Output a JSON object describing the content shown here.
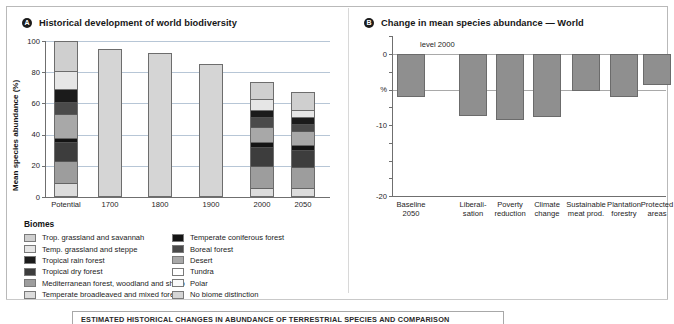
{
  "panels": {
    "left": {
      "marker": "A",
      "title": "Historical development of world biodiversity"
    },
    "right": {
      "marker": "B",
      "title": "Change in mean species abundance — World"
    }
  },
  "caption": "ESTIMATED HISTORICAL CHANGES IN ABUNDANCE OF TERRESTRIAL SPECIES AND COMPARISON",
  "legend": {
    "title": "Biomes",
    "col1": [
      {
        "label": "Trop. grassland and savannah",
        "color": "#cfcfcf"
      },
      {
        "label": "Temp. grassland and steppe",
        "color": "#e6e6e6"
      },
      {
        "label": "Tropical rain forest",
        "color": "#1b1b1b"
      },
      {
        "label": "Tropical dry forest",
        "color": "#3d3d3d"
      },
      {
        "label": "Mediterranean forest, woodland and shrub",
        "color": "#9d9d9d"
      },
      {
        "label": "Temperate broadleaved and mixed forest",
        "color": "#dcdcdc"
      }
    ],
    "col2": [
      {
        "label": "Temperate coniferous forest",
        "color": "#141414"
      },
      {
        "label": "Boreal forest",
        "color": "#4a4a4a"
      },
      {
        "label": "Desert",
        "color": "#a8a8a8"
      },
      {
        "label": "Tundra",
        "color": "#ffffff"
      },
      {
        "label": "Polar",
        "color": "#fafafa"
      },
      {
        "label": "No biome distinction",
        "color": "#d5d5d5"
      }
    ]
  },
  "chart_data": [
    {
      "id": "historical-biodiversity",
      "type": "bar",
      "stacked": true,
      "title": "Historical development of world biodiversity",
      "xlabel": "",
      "ylabel": "Mean species abundance (%)",
      "ylim": [
        0,
        100
      ],
      "yticks": [
        0,
        20,
        40,
        60,
        80,
        100
      ],
      "grid": true,
      "legend_position": "below",
      "categories": [
        "Potential",
        "1700",
        "1800",
        "1900",
        "2000",
        "2050"
      ],
      "totals": [
        100,
        95,
        92,
        85,
        74,
        67
      ],
      "series": [
        {
          "name": "Temperate broadleaved and mixed forest",
          "color": "#dcdcdc",
          "values": [
            9,
            0,
            0,
            0,
            6,
            6
          ]
        },
        {
          "name": "Mediterranean forest, woodland and shrub",
          "color": "#9d9d9d",
          "values": [
            14,
            0,
            0,
            0,
            14,
            13
          ]
        },
        {
          "name": "Tropical dry forest",
          "color": "#3d3d3d",
          "values": [
            12,
            0,
            0,
            0,
            12,
            11
          ]
        },
        {
          "name": "Temperate coniferous forest",
          "color": "#141414",
          "values": [
            3,
            0,
            0,
            0,
            3,
            3
          ]
        },
        {
          "name": "Desert",
          "color": "#a8a8a8",
          "values": [
            15,
            0,
            0,
            0,
            10,
            9
          ]
        },
        {
          "name": "Boreal forest",
          "color": "#4a4a4a",
          "values": [
            8,
            0,
            0,
            0,
            6,
            5
          ]
        },
        {
          "name": "Tropical rain forest",
          "color": "#1b1b1b",
          "values": [
            8,
            0,
            0,
            0,
            5,
            4
          ]
        },
        {
          "name": "Temp. grassland and steppe",
          "color": "#e6e6e6",
          "values": [
            12,
            0,
            0,
            0,
            7,
            5
          ]
        },
        {
          "name": "Trop. grassland and savannah",
          "color": "#cfcfcf",
          "values": [
            19,
            0,
            0,
            0,
            11,
            11
          ]
        },
        {
          "name": "No biome distinction",
          "color": "#d5d5d5",
          "values": [
            0,
            95,
            92,
            85,
            0,
            0
          ]
        }
      ]
    },
    {
      "id": "change-mean-species-abundance-world",
      "type": "bar",
      "title": "Change in mean species abundance — World",
      "xlabel": "",
      "ylabel": "%",
      "ylim": [
        -20,
        2
      ],
      "yticks": [
        0,
        -5,
        -10,
        -20
      ],
      "ytick_labels": [
        "0",
        "%",
        "-10",
        "-20"
      ],
      "grid": true,
      "annotation": "level 2000",
      "categories": [
        "Baseline 2050",
        "Liberali- sation",
        "Poverty reduction",
        "Climate change",
        "Sustainable meat prod.",
        "Plantation forestry",
        "Protected areas"
      ],
      "values": [
        -6.0,
        -8.7,
        -9.3,
        -8.8,
        -5.2,
        -6.1,
        -4.4
      ]
    }
  ],
  "left_axis": {
    "yticks": [
      "100",
      "80",
      "60",
      "40",
      "20",
      "0"
    ],
    "title": "Mean species abundance (%)",
    "xticks": [
      "Potential",
      "1700",
      "1800",
      "1900",
      "2000",
      "2050"
    ]
  },
  "right_axis": {
    "yticks": [
      "0",
      "%",
      "-10",
      "-20"
    ],
    "xticks": [
      {
        "l1": "Baseline",
        "l2": "2050"
      },
      {
        "l1": "Liberali-",
        "l2": "sation"
      },
      {
        "l1": "Poverty",
        "l2": "reduction"
      },
      {
        "l1": "Climate",
        "l2": "change"
      },
      {
        "l1": "Sustainable",
        "l2": "meat prod."
      },
      {
        "l1": "Plantation",
        "l2": "forestry"
      },
      {
        "l1": "Protected",
        "l2": "areas"
      }
    ],
    "annotation": "level 2000"
  }
}
